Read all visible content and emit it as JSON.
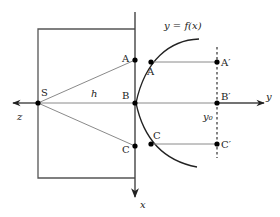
{
  "diagram": {
    "curve_label": "y = f(x)",
    "axes": {
      "x": "x",
      "y": "y",
      "z": "z"
    },
    "points": {
      "S": "S",
      "A": "A",
      "B": "B",
      "C": "C",
      "A_curve": "A",
      "C_curve": "C",
      "A_prime": "A′",
      "B_prime": "B′",
      "C_prime": "C′"
    },
    "distance_label": "h",
    "y0_label": "y₀",
    "colors": {
      "line": "#222222",
      "gray_line": "#8a8a8a",
      "frame": "#555555"
    }
  }
}
